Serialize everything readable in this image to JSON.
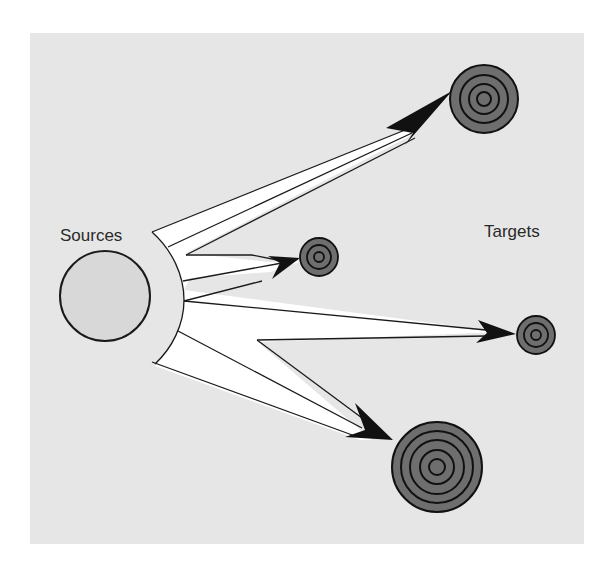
{
  "diagram": {
    "source_label": "Sources",
    "target_label": "Targets",
    "colors": {
      "background": "#e6e6e6",
      "source_fill": "#d8d8d8",
      "target_fill": "#6e6e6e",
      "arrow_fill": "#ffffff",
      "stroke": "#1a1a1a"
    },
    "targets": [
      {
        "id": "top-large",
        "rings": 4
      },
      {
        "id": "middle-small",
        "rings": 3
      },
      {
        "id": "right-small",
        "rings": 3
      },
      {
        "id": "bottom-large",
        "rings": 5
      }
    ]
  }
}
